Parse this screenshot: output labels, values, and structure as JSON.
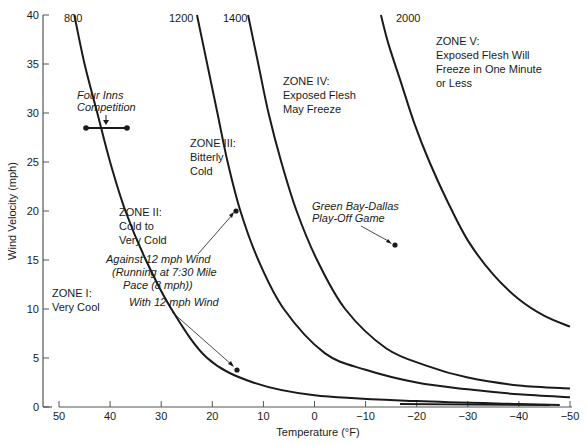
{
  "chart_data": {
    "type": "line",
    "title": "",
    "xlabel": "Temperature (°F)",
    "ylabel": "Wind Velocity (mph)",
    "xlim": [
      50,
      -50
    ],
    "ylim": [
      0,
      40
    ],
    "x_ticks": [
      50,
      40,
      30,
      20,
      10,
      0,
      -10,
      -20,
      -30,
      -40,
      -50
    ],
    "x_tick_labels": [
      "50",
      "40",
      "30",
      "20",
      "10",
      "0",
      "−10",
      "−20",
      "−30",
      "−40",
      "−50"
    ],
    "y_ticks": [
      0,
      5,
      10,
      15,
      20,
      25,
      30,
      35,
      40
    ],
    "y_tick_labels": [
      "0",
      "5",
      "10",
      "15",
      "20",
      "25",
      "30",
      "35",
      "40"
    ],
    "grid": false,
    "series": [
      {
        "name": "800",
        "points": [
          [
            47,
            40
          ],
          [
            45,
            35
          ],
          [
            42.5,
            30
          ],
          [
            40,
            25
          ],
          [
            37,
            20
          ],
          [
            33,
            15
          ],
          [
            28,
            10
          ],
          [
            21,
            5
          ],
          [
            12,
            2.5
          ],
          [
            0,
            1.2
          ],
          [
            -20,
            0.6
          ],
          [
            -40,
            0.3
          ],
          [
            -48,
            0.2
          ]
        ]
      },
      {
        "name": "1200",
        "points": [
          [
            23,
            40
          ],
          [
            21,
            35
          ],
          [
            19,
            30
          ],
          [
            17,
            25
          ],
          [
            14.5,
            20
          ],
          [
            11,
            15
          ],
          [
            6,
            10
          ],
          [
            -2,
            5.5
          ],
          [
            -10,
            3.8
          ],
          [
            -20,
            2.5
          ],
          [
            -30,
            1.8
          ],
          [
            -40,
            1.3
          ],
          [
            -50,
            1.0
          ]
        ]
      },
      {
        "name": "1400",
        "points": [
          [
            13,
            40
          ],
          [
            11,
            35
          ],
          [
            9,
            30
          ],
          [
            6.5,
            25
          ],
          [
            3.5,
            20
          ],
          [
            -0.5,
            15
          ],
          [
            -6,
            10
          ],
          [
            -14,
            6
          ],
          [
            -22,
            4.2
          ],
          [
            -30,
            3
          ],
          [
            -40,
            2.2
          ],
          [
            -50,
            1.9
          ]
        ]
      },
      {
        "name": "2000",
        "points": [
          [
            -13,
            40
          ],
          [
            -14.5,
            37
          ],
          [
            -17,
            33
          ],
          [
            -19.5,
            29
          ],
          [
            -22.5,
            25
          ],
          [
            -26,
            21
          ],
          [
            -30,
            17
          ],
          [
            -35,
            13.5
          ],
          [
            -40,
            11
          ],
          [
            -45,
            9.3
          ],
          [
            -50,
            8.2
          ]
        ]
      }
    ],
    "zones": [
      {
        "name": "ZONE I:",
        "description": "Very Cool"
      },
      {
        "name": "ZONE II:",
        "description": "Cold to Very Cold"
      },
      {
        "name": "ZONE III:",
        "description": "Bitterly Cold"
      },
      {
        "name": "ZONE IV:",
        "description": "Exposed Flesh May Freeze"
      },
      {
        "name": "ZONE V:",
        "description": "Exposed Flesh Will Freeze in One Minute or Less"
      }
    ],
    "annotations": [
      {
        "label": "Four Inns Competition",
        "type": "range",
        "x": [
          45,
          37
        ],
        "y": 28.5
      },
      {
        "label": "Against 12 mph Wind (Running at 7:30 Mile Pace (8 mph))",
        "type": "point",
        "x": 15,
        "y": 20
      },
      {
        "label": "With 12 mph Wind",
        "type": "point",
        "x": 15,
        "y": 4
      },
      {
        "label": "Green Bay-Dallas Play-Off Game",
        "type": "point",
        "x": -15,
        "y": 16.5
      }
    ]
  },
  "labels": {
    "xlabel": "Temperature (°F)",
    "ylabel": "Wind Velocity (mph)",
    "curves": [
      "800",
      "1200",
      "1400",
      "2000"
    ],
    "zone1": [
      "ZONE I:",
      "Very Cool"
    ],
    "zone2": [
      "ZONE II:",
      "Cold to",
      "Very Cold"
    ],
    "zone3": [
      "ZONE III:",
      "Bitterly",
      "Cold"
    ],
    "zone4": [
      "ZONE IV:",
      "Exposed Flesh",
      "May Freeze"
    ],
    "zone5": [
      "ZONE V:",
      "Exposed Flesh Will",
      "Freeze in One Minute",
      "or Less"
    ],
    "four_inns": [
      "Four Inns",
      "Competition"
    ],
    "against": [
      "Against 12 mph Wind",
      "(Running at 7:30 Mile",
      "Pace (8 mph))"
    ],
    "with_wind": "With 12 mph Wind",
    "green_bay": [
      "Green Bay-Dallas",
      "Play-Off Game"
    ]
  },
  "colors": {
    "ink": "#1a1a1a",
    "background": "#ffffff",
    "axis": "#555555"
  }
}
